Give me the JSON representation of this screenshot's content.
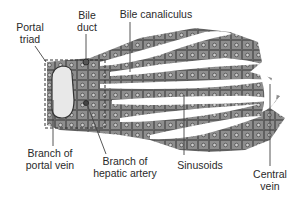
{
  "diagram": {
    "colors": {
      "tissue": "#8c8c8c",
      "tissue_dark": "#5a5a5a",
      "sinusoid": "#ffffff",
      "portal_vein_lumen": "#e8e8e8",
      "line": "#444444",
      "text": "#2a2a2a"
    },
    "labels": {
      "portal_triad": [
        "Portal",
        "triad"
      ],
      "bile_duct": [
        "Bile",
        "duct"
      ],
      "bile_canaliculus": [
        "Bile canaliculus"
      ],
      "branch_portal_vein": [
        "Branch of",
        "portal vein"
      ],
      "branch_hepatic_artery": [
        "Branch of",
        "hepatic artery"
      ],
      "sinusoids": [
        "Sinusoids"
      ],
      "central_vein": [
        "Central",
        "vein"
      ]
    }
  }
}
